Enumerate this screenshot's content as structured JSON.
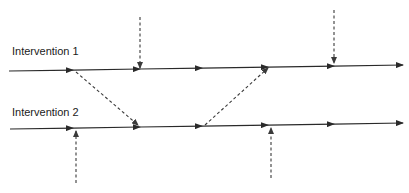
{
  "diagram": {
    "labels": [
      {
        "id": "intervention-1",
        "text": "Intervention 1",
        "x": 12,
        "y": 45
      },
      {
        "id": "intervention-2",
        "text": "Intervention 2",
        "x": 12,
        "y": 106
      }
    ],
    "timelines": [
      {
        "id": "timeline-1",
        "x1": 9,
        "y1": 71,
        "x2": 403,
        "y2": 65,
        "arrow_xs": [
          73,
          140,
          202,
          268,
          334,
          403
        ]
      },
      {
        "id": "timeline-2",
        "x1": 10,
        "y1": 129,
        "x2": 403,
        "y2": 123,
        "arrow_xs": [
          73,
          140,
          202,
          268,
          334,
          403
        ]
      }
    ],
    "dashed_arrows": [
      {
        "id": "external-input-top-left",
        "x1": 140,
        "y1": 17,
        "x2": 140,
        "y2": 68
      },
      {
        "id": "external-input-top-right",
        "x1": 334,
        "y1": 10,
        "x2": 334,
        "y2": 63
      },
      {
        "id": "cross-link-1-to-2",
        "x1": 76,
        "y1": 72,
        "x2": 138,
        "y2": 125
      },
      {
        "id": "cross-link-2-to-1",
        "x1": 205,
        "y1": 125,
        "x2": 268,
        "y2": 68
      },
      {
        "id": "external-input-bottom-left",
        "x1": 76,
        "y1": 183,
        "x2": 76,
        "y2": 131
      },
      {
        "id": "external-input-bottom-right",
        "x1": 271,
        "y1": 178,
        "x2": 271,
        "y2": 128
      }
    ],
    "colors": {
      "line": "#2a2a2a",
      "dashed": "#3a3a3a",
      "text": "#1a1a1a"
    }
  }
}
